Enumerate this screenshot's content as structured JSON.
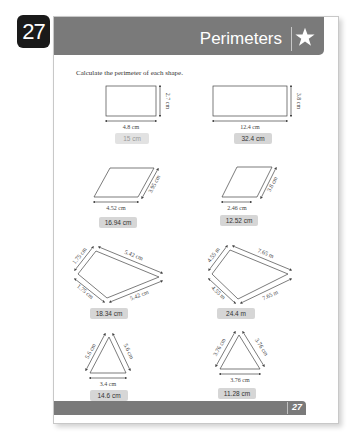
{
  "chapter_number": "27",
  "header": {
    "title": "Perimeters",
    "icon": "star-icon"
  },
  "instruction": "Calculate the perimeter of each shape.",
  "shapes": [
    {
      "type": "rectangle",
      "labels": [
        "4.8 cm",
        "2.7 cm"
      ],
      "answer": "15 cm"
    },
    {
      "type": "rectangle",
      "labels": [
        "12.4 cm",
        "3.8 cm"
      ],
      "answer": "32.4 cm"
    },
    {
      "type": "parallelogram",
      "labels": [
        "4.52 cm",
        "3.95 cm"
      ],
      "answer": "16.94 cm"
    },
    {
      "type": "parallelogram",
      "labels": [
        "2.46 cm",
        "3.8 cm"
      ],
      "answer": "12.52 cm"
    },
    {
      "type": "kite",
      "labels": [
        "1.75 cm",
        "5.42 cm",
        "1.75 cm",
        "5.42 cm"
      ],
      "answer": "18.34 cm"
    },
    {
      "type": "kite",
      "labels": [
        "4.55 m",
        "7.65 m",
        "4.55 m",
        "7.65 m"
      ],
      "answer": "24.4 m"
    },
    {
      "type": "triangle",
      "labels": [
        "5.6 cm",
        "5.6 cm",
        "3.4 cm"
      ],
      "answer": "14.6 cm"
    },
    {
      "type": "triangle",
      "labels": [
        "3.76 cm",
        "3.76 cm",
        "3.76 cm"
      ],
      "answer": "11.28 cm"
    }
  ],
  "footer": {
    "page_number": "27"
  }
}
